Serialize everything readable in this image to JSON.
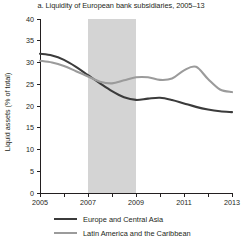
{
  "chart_data": {
    "type": "line",
    "title": "a. Liquidity of European bank subsidiaries, 2005–13",
    "xlabel": "",
    "ylabel": "Liquid assets (% of total)",
    "xlim": [
      2005,
      2013
    ],
    "ylim": [
      0,
      40
    ],
    "xticks": [
      2005,
      2006,
      2007,
      2008,
      2009,
      2010,
      2011,
      2012,
      2013
    ],
    "xtick_labels": [
      "2005",
      "",
      "2007",
      "",
      "2009",
      "",
      "2011",
      "",
      "2013"
    ],
    "yticks": [
      0,
      5,
      10,
      15,
      20,
      25,
      30,
      35,
      40
    ],
    "ytick_labels": [
      "0",
      "5",
      "10",
      "15",
      "20",
      "25",
      "30",
      "35",
      "40"
    ],
    "grid": false,
    "legend_position": "bottom",
    "x": [
      2005,
      2005.5,
      2006,
      2006.5,
      2007,
      2007.5,
      2008,
      2008.5,
      2009,
      2009.5,
      2010,
      2010.5,
      2011,
      2011.5,
      2012,
      2012.5,
      2013
    ],
    "series": [
      {
        "name": "Europe and Central Asia",
        "color": "#3b3b3b",
        "values": [
          32.0,
          31.6,
          30.6,
          29.0,
          27.1,
          25.2,
          23.4,
          22.0,
          21.4,
          21.7,
          21.9,
          21.4,
          20.6,
          19.8,
          19.2,
          18.8,
          18.6
        ]
      },
      {
        "name": "Latin America and the Caribbean",
        "color": "#9b9b9b",
        "values": [
          30.4,
          30.0,
          29.2,
          28.0,
          26.8,
          25.6,
          25.2,
          25.9,
          26.6,
          26.6,
          26.0,
          26.3,
          28.2,
          29.0,
          26.2,
          23.8,
          23.2
        ]
      }
    ],
    "shaded_regions": [
      {
        "name": "crisis-band",
        "x_start": 2007,
        "x_end": 2009,
        "color": "#d4d4d4"
      }
    ]
  },
  "legend": {
    "items": [
      {
        "label": "Europe and Central Asia",
        "color": "#3b3b3b"
      },
      {
        "label": "Latin America and the Caribbean",
        "color": "#9b9b9b"
      }
    ]
  }
}
